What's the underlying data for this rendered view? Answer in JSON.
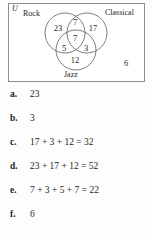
{
  "figure": {
    "universe_symbol": "U",
    "corner_count": "6",
    "sets": [
      {
        "name": "rock-label",
        "label": "Rock"
      },
      {
        "name": "classical-label",
        "label": "Classical"
      },
      {
        "name": "jazz-label",
        "label": "Jazz"
      }
    ],
    "regions": [
      {
        "name": "rock-only",
        "value": "23",
        "x": 50,
        "y": 25
      },
      {
        "name": "rock-classical-only",
        "value": "7",
        "x": 67,
        "y": 19
      },
      {
        "name": "classical-only",
        "value": "17",
        "x": 85,
        "y": 25
      },
      {
        "name": "all-three",
        "value": "7",
        "x": 67,
        "y": 35
      },
      {
        "name": "rock-jazz-only",
        "value": "5",
        "x": 56,
        "y": 45
      },
      {
        "name": "classical-jazz-only",
        "value": "3",
        "x": 78,
        "y": 45
      },
      {
        "name": "jazz-only",
        "value": "12",
        "x": 67,
        "y": 57
      }
    ],
    "circles": [
      {
        "name": "rock-circle",
        "cx": 57,
        "cy": 30,
        "r": 20
      },
      {
        "name": "classical-circle",
        "cx": 79,
        "cy": 30,
        "r": 20
      },
      {
        "name": "jazz-circle",
        "cx": 68,
        "cy": 47,
        "r": 20
      }
    ]
  },
  "options": [
    {
      "letter": "a.",
      "value": "23"
    },
    {
      "letter": "b.",
      "value": "3"
    },
    {
      "letter": "c.",
      "value": "17 + 3 + 12 = 32"
    },
    {
      "letter": "d.",
      "value": "23 + 17 + 12 = 52"
    },
    {
      "letter": "e.",
      "value": "7 + 3 + 5 + 7 = 22"
    },
    {
      "letter": "f.",
      "value": "6"
    }
  ],
  "colors": {
    "page_background": "#fdfdfd",
    "box_border": "#8d8d8d",
    "circle_stroke": "#6f6f6f",
    "text": "#1d1d1d"
  }
}
